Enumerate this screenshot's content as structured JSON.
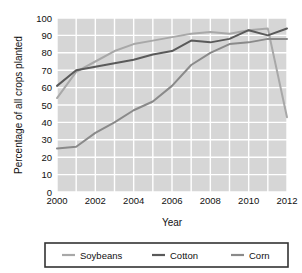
{
  "chart_data": {
    "type": "line",
    "title": "",
    "subtitle": "",
    "xlabel": "Year",
    "ylabel": "Percentage of all crops planted",
    "x": [
      2000,
      2001,
      2002,
      2003,
      2004,
      2005,
      2006,
      2007,
      2008,
      2009,
      2010,
      2011,
      2012
    ],
    "xlim": [
      2000,
      2012
    ],
    "ylim": [
      0,
      100
    ],
    "xticks": [
      2000,
      2002,
      2004,
      2006,
      2008,
      2010,
      2012
    ],
    "xtick_labels": [
      "2000",
      "2002",
      "2004",
      "2006",
      "2008",
      "2010",
      "2012"
    ],
    "yticks": [
      0,
      10,
      20,
      30,
      40,
      50,
      60,
      70,
      80,
      90,
      100
    ],
    "ytick_labels": [
      "0",
      "10",
      "20",
      "30",
      "40",
      "50",
      "60",
      "70",
      "80",
      "90",
      "100"
    ],
    "grid": true,
    "grid_color": "#ffffff",
    "plot_background": "#d6d6d6",
    "legend_position": "bottom",
    "series": [
      {
        "name": "Soybeans",
        "color": "#a8a8a8",
        "values": [
          54,
          69,
          75,
          81,
          85,
          87,
          89,
          91,
          92,
          91,
          93,
          94,
          43
        ]
      },
      {
        "name": "Cotton",
        "color": "#5a5a5a",
        "values": [
          61,
          70,
          72,
          74,
          76,
          79,
          81,
          87,
          86,
          88,
          93,
          90,
          94
        ]
      },
      {
        "name": "Corn",
        "color": "#8a8a8a",
        "values": [
          25,
          26,
          34,
          40,
          47,
          52,
          61,
          73,
          80,
          85,
          86,
          88,
          88
        ]
      }
    ]
  },
  "legend": {
    "items": [
      {
        "label": "Soybeans",
        "color": "#a8a8a8"
      },
      {
        "label": "Cotton",
        "color": "#5a5a5a"
      },
      {
        "label": "Corn",
        "color": "#8a8a8a"
      }
    ]
  },
  "axes": {
    "x_title": "Year",
    "y_title": "Percentage of all crops planted"
  }
}
